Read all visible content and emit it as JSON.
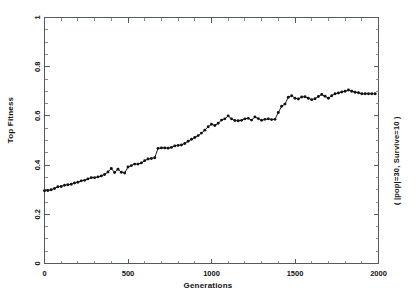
{
  "chart_data": {
    "type": "line",
    "title": "",
    "xlabel": "Generations",
    "ylabel": "Top Fitness",
    "annotation": "( |pop|=30, Survive=10 )",
    "xlim": [
      0,
      2000
    ],
    "ylim": [
      0,
      1
    ],
    "xticks": [
      0,
      500,
      1000,
      1500,
      2000
    ],
    "xtick_labels": [
      "0",
      "500",
      "1000",
      "1500",
      "2000"
    ],
    "xminor_step": 100,
    "yticks": [
      0,
      0.2,
      0.4,
      0.6,
      0.8,
      1
    ],
    "ytick_labels": [
      "0",
      "0.2",
      "0.4",
      "0.6",
      "0.8",
      "1"
    ],
    "yminor_step": 0.05,
    "grid": false,
    "legend": null,
    "marker": "filled-circle",
    "line_color": "#111111",
    "series": [
      {
        "name": "Top Fitness",
        "x": [
          0,
          20,
          40,
          60,
          80,
          100,
          120,
          140,
          160,
          180,
          200,
          220,
          240,
          260,
          280,
          300,
          320,
          340,
          360,
          380,
          400,
          420,
          440,
          460,
          480,
          500,
          520,
          540,
          560,
          580,
          600,
          620,
          640,
          660,
          680,
          700,
          720,
          740,
          760,
          780,
          800,
          820,
          840,
          860,
          880,
          900,
          920,
          940,
          960,
          980,
          1000,
          1020,
          1040,
          1060,
          1080,
          1100,
          1120,
          1140,
          1160,
          1180,
          1200,
          1220,
          1240,
          1260,
          1280,
          1300,
          1320,
          1340,
          1360,
          1380,
          1400,
          1420,
          1440,
          1460,
          1480,
          1500,
          1520,
          1540,
          1560,
          1580,
          1600,
          1620,
          1640,
          1660,
          1680,
          1700,
          1720,
          1740,
          1760,
          1780,
          1800,
          1820,
          1840,
          1860,
          1880,
          1900,
          1920,
          1940,
          1960,
          1980
        ],
        "y": [
          0.296,
          0.297,
          0.3,
          0.305,
          0.312,
          0.313,
          0.318,
          0.32,
          0.322,
          0.327,
          0.33,
          0.336,
          0.338,
          0.344,
          0.349,
          0.349,
          0.352,
          0.356,
          0.362,
          0.372,
          0.386,
          0.37,
          0.383,
          0.371,
          0.368,
          0.392,
          0.398,
          0.404,
          0.404,
          0.409,
          0.418,
          0.425,
          0.427,
          0.43,
          0.468,
          0.47,
          0.47,
          0.469,
          0.472,
          0.478,
          0.48,
          0.482,
          0.488,
          0.497,
          0.505,
          0.512,
          0.52,
          0.53,
          0.542,
          0.556,
          0.566,
          0.561,
          0.57,
          0.583,
          0.588,
          0.6,
          0.588,
          0.581,
          0.58,
          0.582,
          0.588,
          0.59,
          0.583,
          0.596,
          0.589,
          0.582,
          0.586,
          0.588,
          0.585,
          0.586,
          0.614,
          0.639,
          0.648,
          0.676,
          0.682,
          0.672,
          0.669,
          0.677,
          0.678,
          0.672,
          0.666,
          0.67,
          0.679,
          0.687,
          0.68,
          0.672,
          0.682,
          0.69,
          0.693,
          0.697,
          0.7,
          0.705,
          0.7,
          0.696,
          0.694,
          0.69,
          0.69,
          0.69,
          0.69,
          0.69
        ]
      }
    ]
  },
  "figure": {
    "background_color": "#ffffff",
    "frame_color": "#555a60"
  }
}
